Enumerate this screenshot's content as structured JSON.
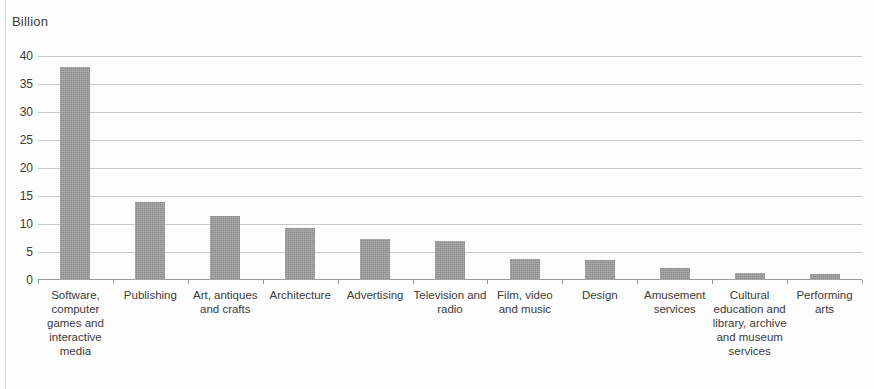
{
  "chart_data": {
    "type": "bar",
    "title": "",
    "subtitle": "",
    "xlabel": "",
    "ylabel": "Billion",
    "ylim": [
      0,
      40
    ],
    "ytick_step": 5,
    "ytick_labels": [
      "40",
      "35",
      "30",
      "25",
      "20",
      "15",
      "10",
      "5",
      "0"
    ],
    "grid": true,
    "legend": "none",
    "bar_color": "#9a9a9a",
    "categories": [
      "Software, computer games and interactive media",
      "Publishing",
      "Art, antiques and crafts",
      "Architecture",
      "Advertising",
      "Television and radio",
      "Film, video and music",
      "Design",
      "Amusement services",
      "Cultural education and library, archive and museum services",
      "Performing arts"
    ],
    "values": [
      38,
      14,
      11.5,
      9.3,
      7.4,
      7,
      3.8,
      3.6,
      2.2,
      1.3,
      1.1
    ]
  }
}
